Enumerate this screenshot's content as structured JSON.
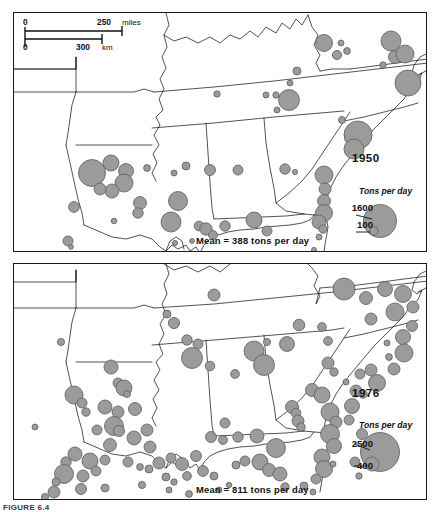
{
  "figure": {
    "caption": "FIGURE 6.4",
    "panels": [
      {
        "id": "1950",
        "year_label": "1950",
        "mean_label": "Mean = 388 tons per day",
        "legend": {
          "title": "Tons per day",
          "large_value": "1600",
          "small_value": "100"
        }
      },
      {
        "id": "1976",
        "year_label": "1976",
        "mean_label": "Mean = 811 tons per day",
        "legend": {
          "title": "Tons per day",
          "large_value": "2500",
          "small_value": "400"
        }
      }
    ],
    "scalebar": {
      "miles_zero": "0",
      "miles_value": "250",
      "miles_unit": "miles",
      "km_zero": "0",
      "km_value": "300",
      "km_unit": "km"
    },
    "colors": {
      "symbol_fill": "#9b9b9b",
      "symbol_stroke": "#5d5d5d",
      "map_line": "#1a1a1a",
      "background": "#ffffff"
    }
  },
  "chart_data": {
    "type": "scatter",
    "subtitle": "Proportional circle map; circle area scaled to tons per day",
    "xlabel": "Longitude (map x)",
    "ylabel": "Latitude (map y)",
    "grid": false,
    "legend_position": "inside-right",
    "series": [
      {
        "name": "1950",
        "units": "tons per day",
        "mean": 388,
        "legend_breaks": [
          1600,
          100
        ],
        "n_points": 56,
        "points": [
          {
            "x": 310,
            "y": 30,
            "r": 8.5
          },
          {
            "x": 327,
            "y": 30,
            "r": 3.0
          },
          {
            "x": 333,
            "y": 38,
            "r": 3.4
          },
          {
            "x": 323,
            "y": 42,
            "r": 4.6
          },
          {
            "x": 377,
            "y": 28,
            "r": 10.0
          },
          {
            "x": 381,
            "y": 44,
            "r": 6.5
          },
          {
            "x": 391,
            "y": 41,
            "r": 9.0
          },
          {
            "x": 369,
            "y": 52,
            "r": 3.2
          },
          {
            "x": 394,
            "y": 70,
            "r": 13.0
          },
          {
            "x": 283,
            "y": 58,
            "r": 4.0
          },
          {
            "x": 276,
            "y": 70,
            "r": 3.0
          },
          {
            "x": 252,
            "y": 82,
            "r": 3.0
          },
          {
            "x": 262,
            "y": 82,
            "r": 3.2
          },
          {
            "x": 275,
            "y": 87,
            "r": 10.5
          },
          {
            "x": 263,
            "y": 97,
            "r": 3.0
          },
          {
            "x": 203,
            "y": 81,
            "r": 3.2
          },
          {
            "x": 328,
            "y": 107,
            "r": 3.5
          },
          {
            "x": 344,
            "y": 122,
            "r": 14.0
          },
          {
            "x": 340,
            "y": 136,
            "r": 10.0
          },
          {
            "x": 310,
            "y": 162,
            "r": 9.0
          },
          {
            "x": 311,
            "y": 176,
            "r": 6.0
          },
          {
            "x": 310,
            "y": 188,
            "r": 6.5
          },
          {
            "x": 310,
            "y": 200,
            "r": 8.5
          },
          {
            "x": 305,
            "y": 209,
            "r": 7.0
          },
          {
            "x": 309,
            "y": 216,
            "r": 4.2
          },
          {
            "x": 305,
            "y": 224,
            "r": 3.0
          },
          {
            "x": 97,
            "y": 150,
            "r": 8.0
          },
          {
            "x": 78,
            "y": 160,
            "r": 13.5
          },
          {
            "x": 112,
            "y": 158,
            "r": 7.5
          },
          {
            "x": 110,
            "y": 170,
            "r": 9.0
          },
          {
            "x": 98,
            "y": 178,
            "r": 7.0
          },
          {
            "x": 86,
            "y": 176,
            "r": 6.0
          },
          {
            "x": 133,
            "y": 155,
            "r": 3.4
          },
          {
            "x": 160,
            "y": 160,
            "r": 3.0
          },
          {
            "x": 126,
            "y": 190,
            "r": 6.5
          },
          {
            "x": 124,
            "y": 200,
            "r": 5.2
          },
          {
            "x": 164,
            "y": 188,
            "r": 9.5
          },
          {
            "x": 157,
            "y": 209,
            "r": 10.0
          },
          {
            "x": 185,
            "y": 213,
            "r": 4.8
          },
          {
            "x": 192,
            "y": 216,
            "r": 6.2
          },
          {
            "x": 199,
            "y": 222,
            "r": 4.5
          },
          {
            "x": 211,
            "y": 213,
            "r": 5.2
          },
          {
            "x": 172,
            "y": 153,
            "r": 4.0
          },
          {
            "x": 196,
            "y": 157,
            "r": 5.5
          },
          {
            "x": 224,
            "y": 157,
            "r": 5.0
          },
          {
            "x": 271,
            "y": 156,
            "r": 5.2
          },
          {
            "x": 281,
            "y": 159,
            "r": 2.6
          },
          {
            "x": 60,
            "y": 194,
            "r": 5.4
          },
          {
            "x": 100,
            "y": 208,
            "r": 2.8
          },
          {
            "x": 54,
            "y": 228,
            "r": 5.0
          },
          {
            "x": 57,
            "y": 234,
            "r": 2.4
          },
          {
            "x": 161,
            "y": 230,
            "r": 2.6
          },
          {
            "x": 240,
            "y": 207,
            "r": 8.0
          },
          {
            "x": 253,
            "y": 218,
            "r": 5.0
          },
          {
            "x": 178,
            "y": 228,
            "r": 2.4
          },
          {
            "x": 300,
            "y": 237,
            "r": 2.6
          }
        ]
      },
      {
        "name": "1976",
        "units": "tons per day",
        "mean": 811,
        "legend_breaks": [
          2500,
          400
        ],
        "n_points": 118,
        "points": [
          {
            "x": 200,
            "y": 31,
            "r": 6.0
          },
          {
            "x": 160,
            "y": 59,
            "r": 5.6
          },
          {
            "x": 153,
            "y": 50,
            "r": 4.0
          },
          {
            "x": 47,
            "y": 78,
            "r": 3.6
          },
          {
            "x": 173,
            "y": 76,
            "r": 5.2
          },
          {
            "x": 184,
            "y": 80,
            "r": 5.0
          },
          {
            "x": 178,
            "y": 94,
            "r": 10.5
          },
          {
            "x": 196,
            "y": 102,
            "r": 4.8
          },
          {
            "x": 221,
            "y": 110,
            "r": 4.4
          },
          {
            "x": 240,
            "y": 87,
            "r": 10.0
          },
          {
            "x": 250,
            "y": 101,
            "r": 10.5
          },
          {
            "x": 253,
            "y": 78,
            "r": 3.6
          },
          {
            "x": 273,
            "y": 80,
            "r": 7.5
          },
          {
            "x": 285,
            "y": 61,
            "r": 5.8
          },
          {
            "x": 308,
            "y": 63,
            "r": 4.4
          },
          {
            "x": 314,
            "y": 77,
            "r": 4.4
          },
          {
            "x": 330,
            "y": 25,
            "r": 11.0
          },
          {
            "x": 352,
            "y": 34,
            "r": 6.5
          },
          {
            "x": 371,
            "y": 25,
            "r": 7.5
          },
          {
            "x": 389,
            "y": 30,
            "r": 8.5
          },
          {
            "x": 399,
            "y": 43,
            "r": 6.0
          },
          {
            "x": 381,
            "y": 48,
            "r": 9.0
          },
          {
            "x": 357,
            "y": 55,
            "r": 6.0
          },
          {
            "x": 398,
            "y": 62,
            "r": 5.5
          },
          {
            "x": 389,
            "y": 73,
            "r": 7.5
          },
          {
            "x": 373,
            "y": 79,
            "r": 3.0
          },
          {
            "x": 375,
            "y": 93,
            "r": 3.4
          },
          {
            "x": 390,
            "y": 89,
            "r": 9.0
          },
          {
            "x": 380,
            "y": 105,
            "r": 6.0
          },
          {
            "x": 357,
            "y": 106,
            "r": 6.0
          },
          {
            "x": 346,
            "y": 110,
            "r": 5.0
          },
          {
            "x": 363,
            "y": 119,
            "r": 8.5
          },
          {
            "x": 342,
            "y": 127,
            "r": 6.0
          },
          {
            "x": 349,
            "y": 130,
            "r": 4.2
          },
          {
            "x": 314,
            "y": 99,
            "r": 6.0
          },
          {
            "x": 320,
            "y": 108,
            "r": 4.2
          },
          {
            "x": 298,
            "y": 126,
            "r": 6.5
          },
          {
            "x": 308,
            "y": 131,
            "r": 8.0
          },
          {
            "x": 278,
            "y": 143,
            "r": 6.5
          },
          {
            "x": 282,
            "y": 149,
            "r": 4.8
          },
          {
            "x": 316,
            "y": 148,
            "r": 9.0
          },
          {
            "x": 322,
            "y": 158,
            "r": 6.0
          },
          {
            "x": 316,
            "y": 170,
            "r": 9.5
          },
          {
            "x": 320,
            "y": 182,
            "r": 7.5
          },
          {
            "x": 308,
            "y": 193,
            "r": 8.0
          },
          {
            "x": 310,
            "y": 205,
            "r": 8.5
          },
          {
            "x": 319,
            "y": 200,
            "r": 3.0
          },
          {
            "x": 338,
            "y": 142,
            "r": 7.5
          },
          {
            "x": 335,
            "y": 156,
            "r": 5.0
          },
          {
            "x": 348,
            "y": 170,
            "r": 5.5
          },
          {
            "x": 352,
            "y": 188,
            "r": 5.2
          },
          {
            "x": 341,
            "y": 198,
            "r": 5.0
          },
          {
            "x": 97,
            "y": 103,
            "r": 7.0
          },
          {
            "x": 104,
            "y": 119,
            "r": 5.0
          },
          {
            "x": 110,
            "y": 124,
            "r": 8.0
          },
          {
            "x": 113,
            "y": 130,
            "r": 3.5
          },
          {
            "x": 60,
            "y": 131,
            "r": 9.0
          },
          {
            "x": 68,
            "y": 139,
            "r": 5.0
          },
          {
            "x": 72,
            "y": 148,
            "r": 4.2
          },
          {
            "x": 91,
            "y": 143,
            "r": 7.0
          },
          {
            "x": 104,
            "y": 148,
            "r": 6.0
          },
          {
            "x": 121,
            "y": 145,
            "r": 6.5
          },
          {
            "x": 100,
            "y": 162,
            "r": 9.5
          },
          {
            "x": 105,
            "y": 167,
            "r": 5.5
          },
          {
            "x": 83,
            "y": 166,
            "r": 5.0
          },
          {
            "x": 21,
            "y": 163,
            "r": 3.0
          },
          {
            "x": 96,
            "y": 181,
            "r": 6.5
          },
          {
            "x": 120,
            "y": 174,
            "r": 7.0
          },
          {
            "x": 133,
            "y": 166,
            "r": 6.0
          },
          {
            "x": 136,
            "y": 183,
            "r": 6.0
          },
          {
            "x": 61,
            "y": 190,
            "r": 7.0
          },
          {
            "x": 52,
            "y": 198,
            "r": 5.2
          },
          {
            "x": 76,
            "y": 197,
            "r": 8.0
          },
          {
            "x": 91,
            "y": 196,
            "r": 5.0
          },
          {
            "x": 50,
            "y": 210,
            "r": 9.5
          },
          {
            "x": 42,
            "y": 218,
            "r": 4.0
          },
          {
            "x": 69,
            "y": 212,
            "r": 6.0
          },
          {
            "x": 82,
            "y": 207,
            "r": 5.0
          },
          {
            "x": 114,
            "y": 198,
            "r": 5.0
          },
          {
            "x": 126,
            "y": 203,
            "r": 3.4
          },
          {
            "x": 135,
            "y": 205,
            "r": 4.0
          },
          {
            "x": 145,
            "y": 199,
            "r": 6.0
          },
          {
            "x": 157,
            "y": 194,
            "r": 5.0
          },
          {
            "x": 168,
            "y": 200,
            "r": 6.5
          },
          {
            "x": 182,
            "y": 192,
            "r": 5.5
          },
          {
            "x": 173,
            "y": 212,
            "r": 4.4
          },
          {
            "x": 189,
            "y": 207,
            "r": 5.4
          },
          {
            "x": 200,
            "y": 212,
            "r": 4.0
          },
          {
            "x": 152,
            "y": 213,
            "r": 4.0
          },
          {
            "x": 160,
            "y": 218,
            "r": 3.2
          },
          {
            "x": 197,
            "y": 173,
            "r": 5.5
          },
          {
            "x": 209,
            "y": 176,
            "r": 4.5
          },
          {
            "x": 224,
            "y": 173,
            "r": 5.2
          },
          {
            "x": 243,
            "y": 172,
            "r": 7.0
          },
          {
            "x": 262,
            "y": 184,
            "r": 9.5
          },
          {
            "x": 211,
            "y": 159,
            "r": 5.0
          },
          {
            "x": 246,
            "y": 198,
            "r": 8.0
          },
          {
            "x": 255,
            "y": 206,
            "r": 6.5
          },
          {
            "x": 266,
            "y": 210,
            "r": 7.0
          },
          {
            "x": 222,
            "y": 201,
            "r": 4.0
          },
          {
            "x": 231,
            "y": 197,
            "r": 5.0
          },
          {
            "x": 155,
            "y": 226,
            "r": 3.0
          },
          {
            "x": 284,
            "y": 157,
            "r": 6.0
          },
          {
            "x": 287,
            "y": 163,
            "r": 4.2
          },
          {
            "x": 215,
            "y": 221,
            "r": 2.8
          },
          {
            "x": 40,
            "y": 228,
            "r": 6.0
          },
          {
            "x": 67,
            "y": 225,
            "r": 5.5
          },
          {
            "x": 31,
            "y": 233,
            "r": 3.6
          },
          {
            "x": 91,
            "y": 224,
            "r": 4.0
          },
          {
            "x": 290,
            "y": 222,
            "r": 4.0
          },
          {
            "x": 302,
            "y": 215,
            "r": 5.0
          },
          {
            "x": 299,
            "y": 228,
            "r": 3.0
          },
          {
            "x": 175,
            "y": 230,
            "r": 3.4
          },
          {
            "x": 205,
            "y": 226,
            "r": 3.0
          },
          {
            "x": 271,
            "y": 223,
            "r": 4.2
          },
          {
            "x": 128,
            "y": 221,
            "r": 3.6
          },
          {
            "x": 345,
            "y": 212,
            "r": 3.2
          },
          {
            "x": 332,
            "y": 118,
            "r": 3.0
          }
        ]
      }
    ]
  }
}
